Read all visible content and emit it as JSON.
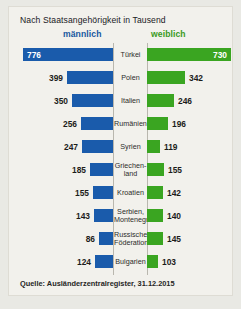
{
  "title": "Nach Staatsangehörigkeit in Tausend",
  "headers": {
    "male": "männlich",
    "female": "weiblich"
  },
  "source": "Quelle: Ausländerzentralregister, 31.12.2015",
  "colors": {
    "male_bar": "#1a5bab",
    "female_bar": "#3aa521",
    "male_header": "#16579f",
    "female_header": "#3a9a1e",
    "panel_bg": "#f2f1ec",
    "page_bg": "#e9e9e4"
  },
  "chart_data": {
    "type": "bar",
    "title": "Nach Staatsangehörigkeit in Tausend",
    "xlabel": "",
    "ylabel": "",
    "unit": "Tausend",
    "orientation": "horizontal",
    "layout": "diverging-paired",
    "legend_position": "top",
    "grid": false,
    "categories": [
      "Türkei",
      "Polen",
      "Italien",
      "Rumänien",
      "Syrien",
      "Griechen-\nland",
      "Kroatien",
      "Serbien,\nMontenegro",
      "Russische\nFöderation",
      "Bulgarien"
    ],
    "series": [
      {
        "name": "männlich",
        "color": "#1a5bab",
        "values": [
          776,
          399,
          350,
          256,
          247,
          185,
          155,
          143,
          86,
          124
        ]
      },
      {
        "name": "weiblich",
        "color": "#3aa521",
        "values": [
          730,
          342,
          246,
          196,
          119,
          155,
          142,
          140,
          145,
          103
        ]
      }
    ]
  },
  "rows": [
    {
      "country_line1": "Türkei",
      "country_line2": "",
      "male": "776",
      "female": "730",
      "male_width": 90,
      "female_width": 84,
      "male_inside": true,
      "female_inside": true,
      "height": 23
    },
    {
      "country_line1": "Polen",
      "country_line2": "",
      "male": "399",
      "female": "342",
      "male_width": 46,
      "female_width": 38,
      "male_inside": false,
      "female_inside": false,
      "height": 23
    },
    {
      "country_line1": "Italien",
      "country_line2": "",
      "male": "350",
      "female": "246",
      "male_width": 41,
      "female_width": 27,
      "male_inside": false,
      "female_inside": false,
      "height": 23
    },
    {
      "country_line1": "Rumänien",
      "country_line2": "",
      "male": "256",
      "female": "196",
      "male_width": 32,
      "female_width": 21,
      "male_inside": false,
      "female_inside": false,
      "height": 23
    },
    {
      "country_line1": "Syrien",
      "country_line2": "",
      "male": "247",
      "female": "119",
      "male_width": 31,
      "female_width": 13,
      "male_inside": false,
      "female_inside": false,
      "height": 23
    },
    {
      "country_line1": "Griechen-",
      "country_line2": "land",
      "male": "185",
      "female": "155",
      "male_width": 23,
      "female_width": 17,
      "male_inside": false,
      "female_inside": false,
      "height": 23
    },
    {
      "country_line1": "Kroatien",
      "country_line2": "",
      "male": "155",
      "female": "142",
      "male_width": 20,
      "female_width": 16,
      "male_inside": false,
      "female_inside": false,
      "height": 23
    },
    {
      "country_line1": "Serbien,",
      "country_line2": "Montenegro",
      "male": "143",
      "female": "140",
      "male_width": 19,
      "female_width": 16,
      "male_inside": false,
      "female_inside": false,
      "height": 23
    },
    {
      "country_line1": "Russische",
      "country_line2": "Föderation",
      "male": "86",
      "female": "145",
      "male_width": 14,
      "female_width": 16,
      "male_inside": false,
      "female_inside": false,
      "height": 23
    },
    {
      "country_line1": "Bulgarien",
      "country_line2": "",
      "male": "124",
      "female": "103",
      "male_width": 18,
      "female_width": 11,
      "male_inside": false,
      "female_inside": false,
      "height": 23
    }
  ]
}
